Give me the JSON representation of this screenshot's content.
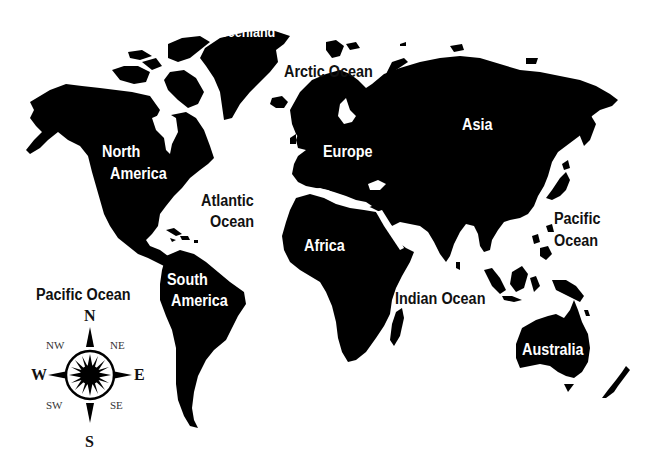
{
  "map": {
    "title": "",
    "style": {
      "land_color": "#000000",
      "water_color": "#ffffff",
      "land_label_color": "#ffffff",
      "ocean_label_color": "#111111"
    },
    "continents": [
      {
        "name": "North America"
      },
      {
        "name": "South America"
      },
      {
        "name": "Europe"
      },
      {
        "name": "Africa"
      },
      {
        "name": "Asia"
      },
      {
        "name": "Australia"
      },
      {
        "name": "Greenland"
      }
    ],
    "labels": {
      "greenland": "Greenland",
      "arctic_ocean": "Arctic Ocean",
      "asia": "Asia",
      "north_america_line1": "North",
      "north_america_line2": "America",
      "europe": "Europe",
      "atlantic_line1": "Atlantic",
      "atlantic_line2": "Ocean",
      "africa": "Africa",
      "pacific_east_line1": "Pacific",
      "pacific_east_line2": "Ocean",
      "south_america_line1": "South",
      "south_america_line2": "America",
      "pacific_west": "Pacific Ocean",
      "indian_ocean": "Indian Ocean",
      "australia": "Australia"
    },
    "compass": {
      "north": "N",
      "south": "S",
      "east": "E",
      "west": "W",
      "northeast": "NE",
      "northwest": "NW",
      "southeast": "SE",
      "southwest": "SW"
    }
  }
}
